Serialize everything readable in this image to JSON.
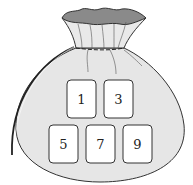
{
  "figure": {
    "colors": {
      "bag_fill": "#e6e6e6",
      "bag_opening": "#8a8a8a",
      "outline": "#333333",
      "card_fill": "#ffffff",
      "background": "#ffffff"
    },
    "cards": [
      {
        "label": "1",
        "row": 1
      },
      {
        "label": "3",
        "row": 1
      },
      {
        "label": "5",
        "row": 2
      },
      {
        "label": "7",
        "row": 2
      },
      {
        "label": "9",
        "row": 2
      }
    ]
  }
}
